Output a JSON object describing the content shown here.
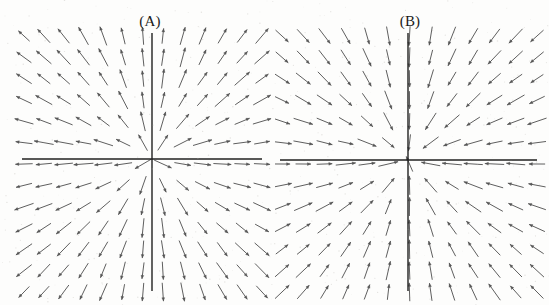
{
  "figure": {
    "title": "",
    "background_color": "#fdfdfc",
    "width": 549,
    "height": 305
  },
  "panels": [
    {
      "id": "A",
      "label": "(A)",
      "label_x": 150,
      "label_y": 21,
      "axes": {
        "origin_x": 152,
        "origin_y": 159,
        "x_axis_start": 22,
        "x_axis_end": 262,
        "y_axis_start": 33,
        "y_axis_end": 291,
        "color": "#202020",
        "line_width": 1.4
      },
      "field": {
        "x_min": 24,
        "x_max": 262,
        "y_min": 36,
        "y_max": 292,
        "cols": 13,
        "rows": 13,
        "arrow_color": "#555555",
        "arrow_length": 17,
        "head_size": 3.4
      }
    },
    {
      "id": "B",
      "label": "(B)",
      "label_x": 410,
      "label_y": 21,
      "axes": {
        "origin_x": 408,
        "origin_y": 160,
        "x_axis_start": 280,
        "x_axis_end": 537,
        "y_axis_start": 33,
        "y_axis_end": 291,
        "color": "#202020",
        "line_width": 1.4
      },
      "field": {
        "x_min": 282,
        "x_max": 537,
        "y_min": 36,
        "y_max": 292,
        "cols": 13,
        "rows": 13,
        "arrow_color": "#555555",
        "arrow_length": 17,
        "head_size": 3.4
      }
    }
  ],
  "chart_data": {
    "type": "scatter",
    "subtype": "direction-field",
    "title": "",
    "xlabel": "",
    "ylabel": "",
    "grid": false,
    "legend": null,
    "panel_count": 2,
    "annotations": [
      "(A)",
      "(B)"
    ],
    "panels": [
      {
        "name": "(A)",
        "axis_x_range": [
          -6,
          6
        ],
        "axis_y_range": [
          -6,
          6
        ],
        "vector_field": {
          "u_expression": "x",
          "v_expression": "y",
          "sign_u": 1,
          "sign_v": 1,
          "quadrant_flow": {
            "upper_left": "downward, slightly left-leaning (arrows nearly vertical pointing down)",
            "upper_right": "rightward, nearly horizontal arrows pointing right",
            "lower_left": "rightward / up-right arrows pointing toward the vertical axis",
            "lower_right": "downward, nearly vertical arrows pointing down"
          },
          "critical_point": [
            0,
            0
          ],
          "classification": "saddle"
        }
      },
      {
        "name": "(B)",
        "axis_x_range": [
          -6,
          6
        ],
        "axis_y_range": [
          -6,
          6
        ],
        "vector_field": {
          "u_expression": "-x",
          "v_expression": "-y",
          "sign_u": -1,
          "sign_v": -1,
          "quadrant_flow": {
            "upper_left": "leftward, nearly horizontal arrows pointing left",
            "upper_right": "downward, nearly vertical arrows pointing down",
            "lower_left": "upward, nearly vertical arrows pointing up",
            "lower_right": "rightward, nearly horizontal arrows pointing right"
          },
          "critical_point": [
            0,
            0
          ],
          "classification": "saddle"
        }
      }
    ]
  }
}
